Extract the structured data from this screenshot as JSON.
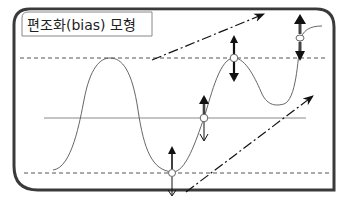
{
  "title": "편조화(bias) 모형",
  "colors": {
    "frame": "#3a3a3a",
    "line": "#555555",
    "guide_dashed": "#555555",
    "center_line": "#8a8a8a",
    "arrow": "#111111",
    "background": "#ffffff"
  },
  "elements": {
    "upper_band": "dashed upper boundary",
    "center_line": "solid center line",
    "lower_band": "dashed lower boundary",
    "wave": "oscillating signal curve",
    "trend_up_upper": "dash-dot upward trend arrow (upper)",
    "trend_up_lower": "dash-dot upward trend arrow (lower)",
    "markers": [
      {
        "name": "trough-marker",
        "up": "thin",
        "down": "thin"
      },
      {
        "name": "center-cross-marker",
        "up": "thick",
        "down": "thin"
      },
      {
        "name": "peak-marker",
        "up": "thick",
        "down": "thick"
      },
      {
        "name": "top-right-marker",
        "up": "thick",
        "down": "thick"
      }
    ]
  }
}
